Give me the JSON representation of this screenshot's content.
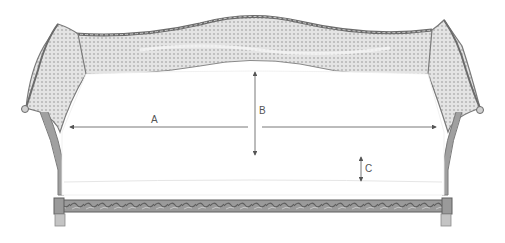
{
  "diagram": {
    "dimensions": [
      {
        "id": "A",
        "label": "A",
        "meaning": "inner width between arms"
      },
      {
        "id": "B",
        "label": "B",
        "meaning": "seat depth / back height"
      },
      {
        "id": "C",
        "label": "C",
        "meaning": "cushion height"
      }
    ]
  },
  "colors": {
    "frame": "#8a8a8a",
    "frame_dark": "#6b6b6b",
    "cane": "#d6d6d6",
    "cane_highlight": "#efefef",
    "rail": "#7d7d7d",
    "cushion": "#ffffff",
    "arrow": "#555555"
  }
}
